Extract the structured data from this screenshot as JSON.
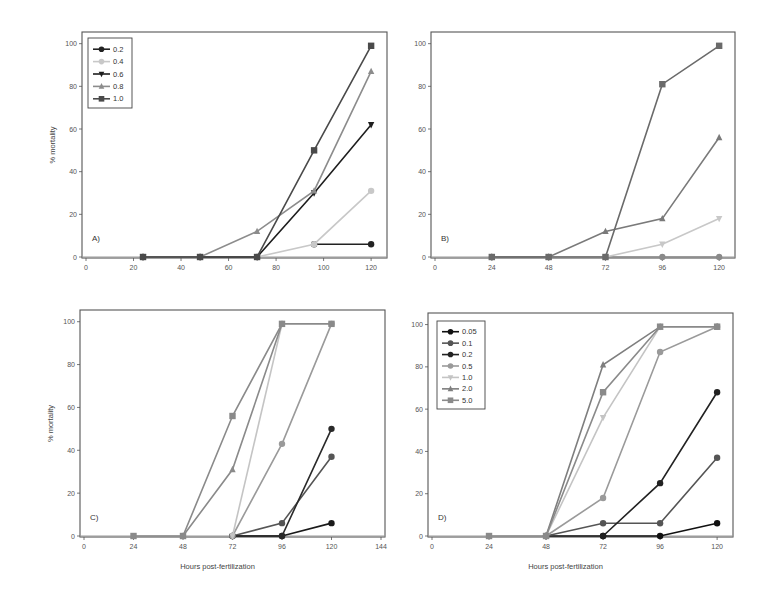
{
  "chart_data": [
    {
      "panel": "A)",
      "type": "line",
      "xlabel": "",
      "ylabel": "% mortality",
      "xlim": [
        0,
        125
      ],
      "ylim": [
        0,
        105
      ],
      "xticks": [
        0,
        20,
        40,
        60,
        80,
        100,
        120
      ],
      "yticks": [
        0,
        20,
        40,
        60,
        80,
        100
      ],
      "frame": {
        "x0": 82,
        "y0": 32,
        "x1": 387,
        "y1": 258
      },
      "legend": {
        "x": 88,
        "y": 38,
        "w": 44,
        "h": 70
      },
      "series": [
        {
          "name": "0.2",
          "marker": "circle",
          "color": "#222222",
          "x": [
            24,
            48,
            72,
            96,
            120
          ],
          "values": [
            0,
            0,
            0,
            6,
            6
          ],
          "segments_from": 3
        },
        {
          "name": "0.4",
          "marker": "circle",
          "color": "#c8c8c8",
          "x": [
            24,
            48,
            72,
            96,
            120
          ],
          "values": [
            0,
            0,
            0,
            6,
            31
          ]
        },
        {
          "name": "0.6",
          "marker": "triangle-down",
          "color": "#1e1e1e",
          "x": [
            24,
            48,
            72,
            96,
            120
          ],
          "values": [
            0,
            0,
            0,
            30,
            62
          ]
        },
        {
          "name": "0.8",
          "marker": "triangle-up",
          "color": "#8c8c8c",
          "x": [
            24,
            48,
            72,
            96,
            120
          ],
          "values": [
            0,
            0,
            12,
            31,
            87
          ]
        },
        {
          "name": "1.0",
          "marker": "square",
          "color": "#4a4a4a",
          "x": [
            24,
            48,
            72,
            96,
            120
          ],
          "values": [
            0,
            0,
            0,
            50,
            99
          ]
        }
      ]
    },
    {
      "panel": "B)",
      "type": "line",
      "xlabel": "",
      "ylabel": "",
      "xlim": [
        0,
        125
      ],
      "ylim": [
        0,
        105
      ],
      "xticks": [
        0,
        24,
        48,
        72,
        96,
        120
      ],
      "yticks": [
        0,
        20,
        40,
        60,
        80,
        100
      ],
      "frame": {
        "x0": 431,
        "y0": 32,
        "x1": 735,
        "y1": 258
      },
      "series": [
        {
          "name": "0.2",
          "marker": "circle",
          "color": "#8a8a8a",
          "x": [
            24,
            48,
            72,
            96,
            120
          ],
          "values": [
            0,
            0,
            0,
            0,
            0
          ]
        },
        {
          "name": "0.4",
          "marker": "triangle-down",
          "color": "#c8c8c8",
          "x": [
            24,
            48,
            72,
            96,
            120
          ],
          "values": [
            0,
            0,
            0,
            6,
            18
          ]
        },
        {
          "name": "0.8",
          "marker": "triangle-up",
          "color": "#7a7a7a",
          "x": [
            24,
            48,
            72,
            96,
            120
          ],
          "values": [
            0,
            0,
            12,
            18,
            56
          ]
        },
        {
          "name": "1.0",
          "marker": "square",
          "color": "#6a6a6a",
          "x": [
            24,
            48,
            72,
            96,
            120
          ],
          "values": [
            0,
            0,
            0,
            81,
            99
          ]
        }
      ]
    },
    {
      "panel": "C)",
      "type": "line",
      "xlabel": "Hours post-fertilization",
      "ylabel": "% mortality",
      "xlim": [
        0,
        144
      ],
      "ylim": [
        0,
        105
      ],
      "xticks": [
        0,
        24,
        48,
        72,
        96,
        120,
        144
      ],
      "yticks": [
        0,
        20,
        40,
        60,
        80,
        100
      ],
      "frame": {
        "x0": 80,
        "y0": 310,
        "x1": 385,
        "y1": 537
      },
      "series": [
        {
          "name": "0.05",
          "marker": "circle",
          "color": "#1a1a1a",
          "x": [
            72,
            96,
            120
          ],
          "values": [
            0,
            0,
            6
          ]
        },
        {
          "name": "0.1",
          "marker": "circle",
          "color": "#555555",
          "x": [
            72,
            96,
            120
          ],
          "values": [
            0,
            6,
            37
          ]
        },
        {
          "name": "0.2",
          "marker": "circle",
          "color": "#2a2a2a",
          "x": [
            72,
            96,
            120
          ],
          "values": [
            0,
            0,
            50
          ]
        },
        {
          "name": "0.5",
          "marker": "circle",
          "color": "#9a9a9a",
          "x": [
            72,
            96,
            120
          ],
          "values": [
            0,
            43,
            99
          ]
        },
        {
          "name": "1.0",
          "marker": "triangle-down",
          "color": "#c4c4c4",
          "x": [
            72,
            96
          ],
          "values": [
            0,
            99
          ]
        },
        {
          "name": "2.0",
          "marker": "triangle-up",
          "color": "#8a8a8a",
          "x": [
            48,
            72,
            96
          ],
          "values": [
            0,
            31,
            99
          ]
        },
        {
          "name": "5.0",
          "marker": "square",
          "color": "#8a8a8a",
          "x": [
            24,
            48,
            72,
            96,
            120
          ],
          "values": [
            0,
            0,
            56,
            99,
            99
          ]
        }
      ]
    },
    {
      "panel": "D)",
      "type": "line",
      "xlabel": "Hours post-fertilization",
      "ylabel": "",
      "xlim": [
        0,
        125
      ],
      "ylim": [
        0,
        105
      ],
      "xticks": [
        0,
        24,
        48,
        72,
        96,
        120
      ],
      "yticks": [
        0,
        20,
        40,
        60,
        80,
        100
      ],
      "frame": {
        "x0": 428,
        "y0": 313,
        "x1": 733,
        "y1": 537
      },
      "legend": {
        "x": 437,
        "y": 321,
        "w": 48,
        "h": 88
      },
      "series": [
        {
          "name": "0.05",
          "marker": "circle",
          "color": "#111111",
          "x": [
            48,
            72,
            96,
            120
          ],
          "values": [
            0,
            0,
            0,
            6
          ]
        },
        {
          "name": "0.1",
          "marker": "circle",
          "color": "#555555",
          "x": [
            48,
            72,
            96,
            120
          ],
          "values": [
            0,
            6,
            6,
            37
          ]
        },
        {
          "name": "0.2",
          "marker": "circle",
          "color": "#222222",
          "x": [
            72,
            96,
            120
          ],
          "values": [
            0,
            25,
            68
          ]
        },
        {
          "name": "0.5",
          "marker": "circle",
          "color": "#9a9a9a",
          "x": [
            48,
            72,
            96,
            120
          ],
          "values": [
            0,
            18,
            87,
            99
          ]
        },
        {
          "name": "1.0",
          "marker": "triangle-down",
          "color": "#c4c4c4",
          "x": [
            48,
            72,
            96
          ],
          "values": [
            0,
            56,
            99
          ]
        },
        {
          "name": "2.0",
          "marker": "triangle-up",
          "color": "#7e7e7e",
          "x": [
            48,
            72,
            96,
            120
          ],
          "values": [
            0,
            81,
            99,
            99
          ]
        },
        {
          "name": "5.0",
          "marker": "square",
          "color": "#8a8a8a",
          "x": [
            24,
            48,
            72,
            96,
            120
          ],
          "values": [
            0,
            0,
            68,
            99,
            99
          ]
        }
      ]
    }
  ]
}
